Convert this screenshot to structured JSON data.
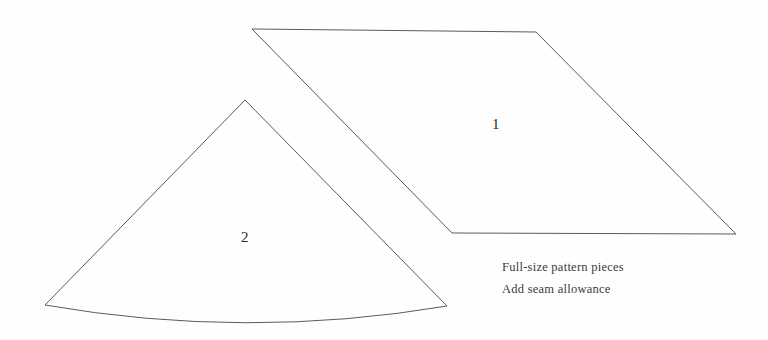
{
  "document": {
    "title": "Full-size pattern pieces",
    "background_color": "#fefefe",
    "stroke_color": "#5a5a5a",
    "text_color": "#3b3b3b",
    "width": 768,
    "height": 340
  },
  "pieces": [
    {
      "number": "1",
      "shape": "parallelogram",
      "label_x": 492,
      "label_y": 117,
      "vertices": [
        [
          252,
          29
        ],
        [
          536,
          32
        ],
        [
          736,
          234
        ],
        [
          452,
          233
        ]
      ],
      "path": "M 252 29 L 536 32 L 736 234 L 452 233 Z"
    },
    {
      "number": "2",
      "shape": "circular-sector",
      "label_x": 241,
      "label_y": 230,
      "apex": [
        245,
        100
      ],
      "left_corner": [
        45,
        305
      ],
      "right_corner": [
        447,
        306
      ],
      "arc_sag_y": 327,
      "path": "M 245 100 L 45 305 Q 246 340 447 306 Z"
    }
  ],
  "caption": {
    "lines": [
      "Full-size pattern pieces",
      "Add seam allowance"
    ]
  }
}
